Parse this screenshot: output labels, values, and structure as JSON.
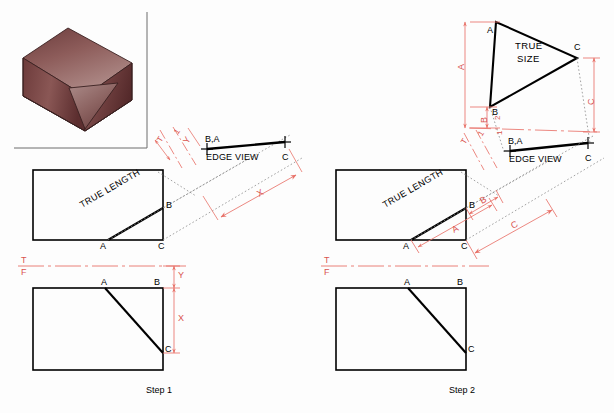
{
  "figure": {
    "title_step1": "Step 1",
    "title_step2": "Step 2",
    "colors": {
      "object_line": "#000000",
      "dimension_red": "#e8736a",
      "label_red": "#d9534f",
      "projection_gray": "#8a8a8a",
      "frame_gray": "#6d6d6d",
      "solid_light": "#9c6a68",
      "solid_mid": "#7e4a49",
      "solid_dark": "#5e2f30",
      "solid_top_light": "#a87b79",
      "cut_face": "#b08e8c"
    }
  },
  "pictorial": {
    "name": "isometric-solid-with-oblique-cut-face"
  },
  "step1": {
    "caption": "Step 1",
    "top_view": {
      "true_length_label": "TRUE LENGTH",
      "vertex_a": "A",
      "vertex_b": "B",
      "vertex_c": "C"
    },
    "auxiliary_view": {
      "edge_view_label": "EDGE VIEW",
      "end_label_ba": "B,A",
      "end_label_c": "C",
      "fold_top_label": "T",
      "fold_aux_label": "1",
      "dim_y": "Y",
      "dim_x": "X"
    },
    "front_view": {
      "fold_t": "T",
      "fold_f": "F",
      "vertex_a": "A",
      "vertex_b": "B",
      "vertex_c": "C",
      "dim_y": "Y",
      "dim_x": "X"
    }
  },
  "step2": {
    "caption": "Step 2",
    "true_size_view": {
      "true_size_label_line1": "TRUE",
      "true_size_label_line2": "SIZE",
      "vertex_a": "A",
      "vertex_b": "B",
      "vertex_c": "C",
      "dim_a": "A",
      "dim_b": "B",
      "dim_c": "C",
      "fold_aux1_label": "1",
      "fold_aux2_label": "2"
    },
    "top_view": {
      "true_length_label": "TRUE LENGTH",
      "vertex_a": "A",
      "vertex_b": "B",
      "vertex_c": "C",
      "dim_a": "A",
      "dim_b": "B",
      "dim_c": "C"
    },
    "auxiliary_view": {
      "edge_view_label": "EDGE VIEW",
      "end_label_ba": "B,A",
      "end_label_c": "C",
      "fold_top_label": "T",
      "fold_aux_label": "1"
    },
    "front_view": {
      "fold_t": "T",
      "fold_f": "F",
      "vertex_a": "A",
      "vertex_b": "B",
      "vertex_c": "C"
    }
  }
}
